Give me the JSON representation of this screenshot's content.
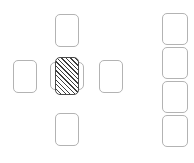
{
  "diagram": {
    "canvas": {
      "width": 194,
      "height": 163,
      "background": "#ffffff"
    },
    "style": {
      "card_border_color": "#b3b3b3",
      "card_fill_color": "#ffffff",
      "selected_border_color": "#4a4a4a",
      "hatch_line_color": "#3f3f3f",
      "hatch_angle": "45deg",
      "corner_radius": "5px"
    },
    "groups": [
      {
        "id": "cross-cluster",
        "name": "cross-cluster",
        "cards": [
          {
            "id": "card-top",
            "name": "card-top",
            "x": 55,
            "y": 14,
            "w": 24,
            "h": 33,
            "state": "plain",
            "layer": "front"
          },
          {
            "id": "card-left",
            "name": "card-left",
            "x": 13,
            "y": 60,
            "w": 24,
            "h": 33,
            "state": "plain",
            "layer": "front"
          },
          {
            "id": "card-behind",
            "name": "card-behind-center",
            "x": 50,
            "y": 62,
            "w": 34,
            "h": 28,
            "state": "plain",
            "layer": "behind"
          },
          {
            "id": "card-center",
            "name": "card-center-selected",
            "x": 55,
            "y": 57,
            "w": 24,
            "h": 38,
            "state": "hatched",
            "layer": "front"
          },
          {
            "id": "card-right",
            "name": "card-right",
            "x": 99,
            "y": 60,
            "w": 24,
            "h": 33,
            "state": "plain",
            "layer": "front"
          },
          {
            "id": "card-bottom",
            "name": "card-bottom",
            "x": 55,
            "y": 113,
            "w": 24,
            "h": 33,
            "state": "plain",
            "layer": "front"
          }
        ]
      },
      {
        "id": "right-column",
        "name": "right-column-stack",
        "cards": [
          {
            "id": "col-1",
            "name": "column-card-1",
            "x": 162,
            "y": 13,
            "w": 26,
            "h": 32,
            "state": "plain",
            "layer": "front"
          },
          {
            "id": "col-2",
            "name": "column-card-2",
            "x": 162,
            "y": 47,
            "w": 26,
            "h": 32,
            "state": "plain",
            "layer": "front"
          },
          {
            "id": "col-3",
            "name": "column-card-3",
            "x": 162,
            "y": 81,
            "w": 26,
            "h": 32,
            "state": "plain",
            "layer": "front"
          },
          {
            "id": "col-4",
            "name": "column-card-4",
            "x": 162,
            "y": 115,
            "w": 26,
            "h": 32,
            "state": "plain",
            "layer": "front"
          }
        ]
      }
    ]
  }
}
